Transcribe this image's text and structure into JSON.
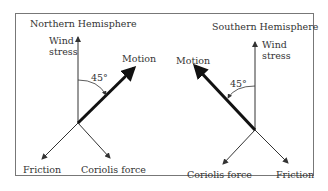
{
  "diagram": {
    "panels": [
      {
        "title": "Northern Hemisphere",
        "wind_stress_label_line1": "Wind",
        "wind_stress_label_line2": "stress",
        "motion_label": "Motion",
        "angle_label": "45°",
        "friction_label": "Friction",
        "coriolis_label": "Coriolis force"
      },
      {
        "title": "Southern Hemisphere",
        "wind_stress_label_line1": "Wind",
        "wind_stress_label_line2": "stress",
        "motion_label": "Motion",
        "angle_label": "45°",
        "friction_label": "Friction",
        "coriolis_label": "Coriolis force"
      }
    ],
    "colors": {
      "line": "#333333",
      "motion": "#111111",
      "frame": "#777777"
    }
  }
}
